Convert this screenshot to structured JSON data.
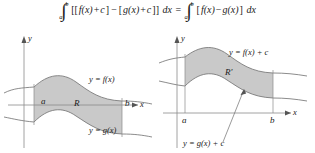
{
  "formula": {
    "integral_symbol": "∫",
    "left_integral": {
      "lower_limit": "a",
      "upper_limit": "b",
      "integrand_open": "[[",
      "f_term": "f(x)",
      "plus": "+",
      "c1": "c",
      "close1": "]",
      "minus": "−",
      "open2": "[",
      "g_term": "g(x)",
      "plus2": "+",
      "c2": "c",
      "close2": "]]",
      "differential": "dx"
    },
    "equals": "=",
    "right_integral": {
      "lower_limit": "a",
      "upper_limit": "b",
      "open": "[",
      "f_term": "f(x)",
      "minus": "−",
      "g_term": "g(x)",
      "close": "]",
      "differential": "dx"
    },
    "full_text": "∫ₐᵇ [[f(x) + c] − [g(x) + c]] dx = ∫ₐᵇ [f(x) − g(x)] dx"
  },
  "figures": [
    {
      "id": "left",
      "axis_x_label": "x",
      "axis_y_label": "y",
      "region_label": "R",
      "upper_curve_label": "y = f(x)",
      "lower_curve_label": "y = g(x)",
      "bound_left_label": "a",
      "bound_right_label": "b",
      "fill_color": "#c9c9c9",
      "stroke_color": "#6e6e6e",
      "axis_color": "#8a8a8a"
    },
    {
      "id": "right",
      "axis_x_label": "x",
      "axis_y_label": "y",
      "region_label": "R'",
      "upper_curve_label": "y = f(x) + c",
      "lower_curve_label": "y = g(x) + c",
      "bound_left_label": "a",
      "bound_right_label": "b",
      "fill_color": "#c9c9c9",
      "stroke_color": "#6e6e6e",
      "axis_color": "#8a8a8a"
    }
  ]
}
